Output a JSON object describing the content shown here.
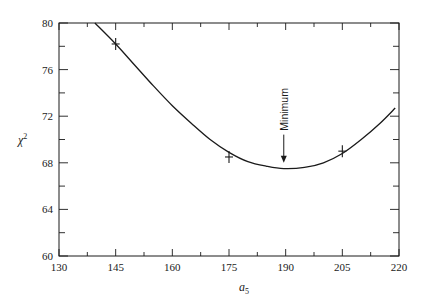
{
  "chart_data": {
    "type": "line",
    "title": "",
    "xlabel": "a",
    "xlabel_subscript": "5",
    "ylabel": "χ",
    "ylabel_superscript": "2",
    "xlim": [
      130,
      220
    ],
    "ylim": [
      60,
      80
    ],
    "x_ticks": [
      130,
      145,
      160,
      175,
      190,
      205,
      220
    ],
    "x_minor_ticks": [
      137.5,
      152.5,
      167.5,
      182.5,
      197.5,
      212.5
    ],
    "y_ticks": [
      60,
      64,
      68,
      72,
      76,
      80
    ],
    "y_minor_ticks": [
      62,
      66,
      70,
      74,
      78
    ],
    "grid": false,
    "legend": null,
    "series": [
      {
        "name": "fit curve",
        "style": "line",
        "x": [
          139.5,
          145,
          150,
          155,
          160,
          165,
          170,
          175,
          180,
          185,
          189.5,
          195,
          200,
          205,
          210,
          215,
          219
        ],
        "values": [
          80.0,
          78.2,
          76.4,
          74.6,
          72.9,
          71.4,
          70.0,
          68.9,
          68.1,
          67.7,
          67.5,
          67.6,
          68.0,
          68.8,
          70.0,
          71.4,
          72.7
        ]
      },
      {
        "name": "data points",
        "style": "points-with-errorbars",
        "x": [
          145,
          175,
          205
        ],
        "values": [
          78.2,
          68.5,
          69.0
        ]
      }
    ],
    "annotations": [
      {
        "text": "Minimum",
        "x": 189.5,
        "y": 67.5,
        "arrow": "down",
        "orientation": "vertical"
      }
    ]
  }
}
